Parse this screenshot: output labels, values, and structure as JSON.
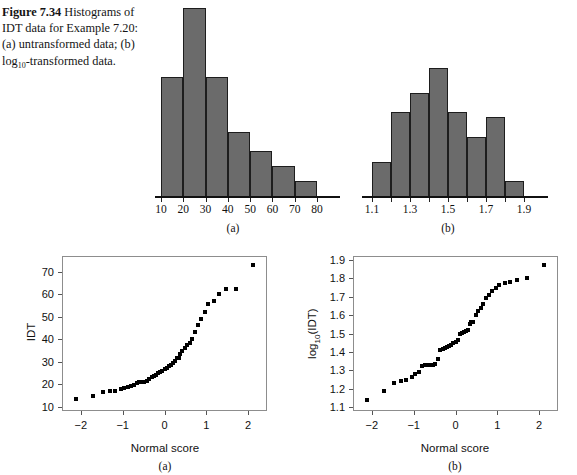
{
  "caption": {
    "figure_number": "Figure 7.34",
    "text_lead": "Histograms of IDT data for Example 7.20: (a) untransformed data; (b) log",
    "subscript": "10",
    "text_tail": "-transformed data."
  },
  "panel_tags": {
    "hist_a": "(a)",
    "hist_b": "(b)",
    "qq_a": "(a)",
    "qq_b": "(b)"
  },
  "chart_data": [
    {
      "id": "histogram-untransformed",
      "type": "bar",
      "title": "",
      "xlabel": "",
      "ylabel": "",
      "panel": "(a)",
      "grid": false,
      "legend": "none",
      "bin_edges": [
        10,
        20,
        30,
        40,
        50,
        60,
        70,
        80
      ],
      "categories": [
        "10-20",
        "20-30",
        "30-40",
        "40-50",
        "50-60",
        "60-70",
        "70-80"
      ],
      "values": [
        24,
        38,
        24,
        13,
        9,
        6,
        3
      ],
      "xlim": [
        10,
        80
      ],
      "ylim": [
        0,
        38
      ],
      "xticks": [
        10,
        20,
        30,
        40,
        50,
        60,
        70,
        80
      ],
      "xticklabels": [
        "10",
        "20",
        "30",
        "40",
        "50",
        "60",
        "70",
        "80"
      ],
      "bar_color": "#6b6b6b",
      "bar_edge_color": "#1d1d1d"
    },
    {
      "id": "histogram-log10-transformed",
      "type": "bar",
      "title": "",
      "xlabel": "",
      "ylabel": "",
      "panel": "(b)",
      "grid": false,
      "legend": "none",
      "bin_edges": [
        1.1,
        1.2,
        1.3,
        1.4,
        1.5,
        1.6,
        1.7,
        1.8,
        1.9
      ],
      "categories": [
        "1.1-1.2",
        "1.2-1.3",
        "1.3-1.4",
        "1.4-1.5",
        "1.5-1.6",
        "1.6-1.7",
        "1.7-1.8",
        "1.8-1.9"
      ],
      "values": [
        7,
        17,
        21,
        26,
        17,
        12,
        16,
        3
      ],
      "xlim": [
        1.1,
        1.9
      ],
      "ylim": [
        0,
        26
      ],
      "xticks": [
        1.1,
        1.2,
        1.3,
        1.4,
        1.5,
        1.6,
        1.7,
        1.8,
        1.9
      ],
      "xticklabels": [
        "1.1",
        "",
        "1.3",
        "",
        "1.5",
        "",
        "1.7",
        "",
        "1.9"
      ],
      "xticklabels_shown": [
        "1.1",
        "1.3",
        "1.5",
        "1.7",
        "1.9"
      ],
      "bar_color": "#6b6b6b",
      "bar_edge_color": "#1d1d1d"
    },
    {
      "id": "qqplot-idt",
      "type": "scatter",
      "title": "",
      "xlabel": "Normal score",
      "ylabel": "IDT",
      "panel": "(a)",
      "grid": false,
      "legend": "none",
      "xlim": [
        -2.45,
        2.45
      ],
      "ylim": [
        8,
        77
      ],
      "xticks": [
        -2,
        -1,
        0,
        1,
        2
      ],
      "xticklabels": [
        "-2",
        "-1",
        "0",
        "1",
        "2"
      ],
      "yticks": [
        10,
        20,
        30,
        40,
        50,
        60,
        70
      ],
      "yticklabels": [
        "10",
        "20",
        "30",
        "40",
        "50",
        "60",
        "70"
      ],
      "marker": "square",
      "marker_color": "#000000",
      "x": [
        -2.12,
        -1.72,
        -1.48,
        -1.3,
        -1.18,
        -1.05,
        -0.96,
        -0.88,
        -0.8,
        -0.73,
        -0.66,
        -0.6,
        -0.54,
        -0.48,
        -0.42,
        -0.37,
        -0.31,
        -0.26,
        -0.21,
        -0.16,
        -0.11,
        -0.05,
        0.0,
        0.05,
        0.11,
        0.16,
        0.21,
        0.26,
        0.31,
        0.34,
        0.37,
        0.42,
        0.48,
        0.54,
        0.6,
        0.66,
        0.73,
        0.8,
        0.88,
        0.96,
        1.05,
        1.18,
        1.3,
        1.48,
        1.72,
        2.12
      ],
      "y": [
        13.2,
        14.8,
        16.3,
        16.8,
        17.0,
        17.6,
        18.2,
        18.8,
        19.2,
        19.6,
        20.4,
        20.7,
        20.9,
        21.0,
        21.5,
        22.4,
        23.0,
        23.6,
        24.2,
        24.8,
        25.4,
        26.0,
        26.6,
        27.2,
        27.9,
        28.6,
        29.4,
        30.2,
        31.6,
        31.8,
        33.4,
        34.6,
        36.0,
        37.6,
        38.4,
        40.2,
        43.2,
        46.2,
        48.8,
        52.0,
        55.6,
        57.0,
        60.2,
        62.2,
        62.4,
        73.2
      ]
    },
    {
      "id": "qqplot-log10-idt",
      "type": "scatter",
      "title": "",
      "xlabel": "Normal score",
      "ylabel": "log10(IDT)",
      "ylabel_base": "log",
      "ylabel_sub": "10",
      "ylabel_rest": "(IDT)",
      "panel": "(b)",
      "grid": false,
      "legend": "none",
      "xlim": [
        -2.45,
        2.45
      ],
      "ylim": [
        1.08,
        1.92
      ],
      "xticks": [
        -2,
        -1,
        0,
        1,
        2
      ],
      "xticklabels": [
        "-2",
        "-1",
        "0",
        "1",
        "2"
      ],
      "yticks": [
        1.1,
        1.2,
        1.3,
        1.4,
        1.5,
        1.6,
        1.7,
        1.8,
        1.9
      ],
      "yticklabels": [
        "1.1",
        "1.2",
        "1.3",
        "1.4",
        "1.5",
        "1.6",
        "1.7",
        "1.8",
        "1.9"
      ],
      "marker": "square",
      "marker_color": "#000000",
      "x": [
        -2.12,
        -1.72,
        -1.48,
        -1.3,
        -1.18,
        -1.05,
        -0.96,
        -0.88,
        -0.8,
        -0.73,
        -0.66,
        -0.6,
        -0.54,
        -0.48,
        -0.42,
        -0.37,
        -0.31,
        -0.26,
        -0.21,
        -0.16,
        -0.11,
        -0.05,
        0.0,
        0.05,
        0.11,
        0.16,
        0.21,
        0.26,
        0.31,
        0.34,
        0.37,
        0.42,
        0.48,
        0.54,
        0.6,
        0.66,
        0.73,
        0.8,
        0.88,
        0.96,
        1.05,
        1.18,
        1.3,
        1.48,
        1.72,
        2.12
      ],
      "y": [
        1.14,
        1.19,
        1.23,
        1.245,
        1.25,
        1.265,
        1.28,
        1.29,
        1.325,
        1.327,
        1.329,
        1.33,
        1.332,
        1.335,
        1.36,
        1.41,
        1.415,
        1.42,
        1.425,
        1.43,
        1.44,
        1.45,
        1.455,
        1.465,
        1.5,
        1.505,
        1.51,
        1.515,
        1.52,
        1.55,
        1.56,
        1.565,
        1.6,
        1.62,
        1.64,
        1.66,
        1.69,
        1.71,
        1.73,
        1.745,
        1.765,
        1.775,
        1.78,
        1.79,
        1.8,
        1.87
      ]
    }
  ]
}
